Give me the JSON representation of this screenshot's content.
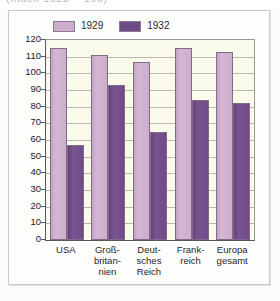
{
  "top_fragment": "(Index 1928 = 100)",
  "chart_data": {
    "type": "bar",
    "title": "",
    "subtitle": "",
    "xlabel": "",
    "ylabel": "",
    "ylim": [
      0,
      120
    ],
    "ytick_step": 10,
    "yticks": [
      120,
      110,
      100,
      90,
      80,
      70,
      60,
      50,
      40,
      30,
      20,
      10,
      0
    ],
    "grid": true,
    "legend_position": "top-left",
    "categories": [
      "USA",
      "Groß-britan-nien",
      "Deut-sches Reich",
      "Frank-reich",
      "Europa gesamt"
    ],
    "category_lines": [
      [
        "USA"
      ],
      [
        "Groß-",
        "britan-",
        "nien"
      ],
      [
        "Deut-",
        "sches",
        "Reich"
      ],
      [
        "Frank-",
        "reich"
      ],
      [
        "Europa",
        "gesamt"
      ]
    ],
    "series": [
      {
        "name": "1929",
        "color": "#cdaecd",
        "values": [
          115,
          111,
          107,
          115,
          113
        ]
      },
      {
        "name": "1932",
        "color": "#6f4b87",
        "values": [
          57,
          93,
          65,
          84,
          82
        ]
      }
    ]
  },
  "legend": {
    "items": [
      {
        "label": "1929",
        "color": "#cdaecd"
      },
      {
        "label": "1932",
        "color": "#6f4b87"
      }
    ]
  },
  "colors": {
    "plot_background": "#fbfbec",
    "page_background": "#fdfdfb",
    "gridline": "#b9b9a8",
    "axis": "#58585a",
    "series_1929": "#cdaecd",
    "series_1932": "#6f4b87",
    "bar_border": "#7d6b88"
  }
}
